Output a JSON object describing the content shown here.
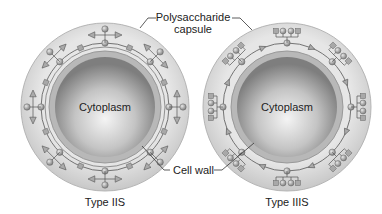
{
  "labels": {
    "capsule_line1": "Polysaccharide",
    "capsule_line2": "capsule",
    "cell_wall": "Cell wall",
    "cytoplasm_left": "Cytoplasm",
    "cytoplasm_right": "Cytoplasm",
    "type_left": "Type IIS",
    "type_right": "Type IIIS"
  },
  "colors": {
    "capsule": "#d9d9d9",
    "wall": "#bdbdbd",
    "cytoplasm_edge": "#8a8a8a",
    "cytoplasm_center": "#f2f2f2",
    "line": "#555555",
    "sugar": "#9a9a9a"
  }
}
